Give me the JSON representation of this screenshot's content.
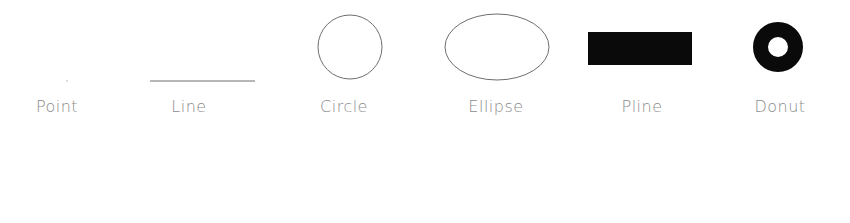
{
  "shapes": [
    {
      "id": "point",
      "label": "Point",
      "label_x": 57
    },
    {
      "id": "line",
      "label": "Line",
      "label_x": 189
    },
    {
      "id": "circle",
      "label": "Circle",
      "label_x": 344
    },
    {
      "id": "ellipse",
      "label": "Ellipse",
      "label_x": 496
    },
    {
      "id": "pline",
      "label": "Pline",
      "label_x": 642
    },
    {
      "id": "donut",
      "label": "Donut",
      "label_x": 780
    }
  ],
  "colors": {
    "outline": "#6e6e6e",
    "fill": "#0a0a0a",
    "label": "#8a8a8a"
  }
}
